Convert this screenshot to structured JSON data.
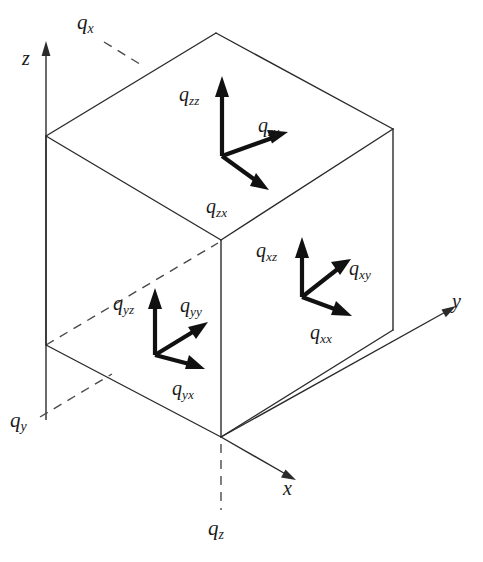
{
  "figure": {
    "type": "isometric-cube-tensor-diagram",
    "background_color": "#ffffff",
    "line_color": "#2b2b2b",
    "vector_color": "#111111",
    "width": 483,
    "height": 562
  },
  "axes": [
    {
      "id": "z",
      "label": "z",
      "symbol": "z",
      "direction": "up",
      "label_x": 22,
      "label_y": 48
    },
    {
      "id": "x",
      "label": "x",
      "symbol": "x",
      "direction": "down-right",
      "label_x": 283,
      "label_y": 478
    },
    {
      "id": "y",
      "label": "y",
      "symbol": "y",
      "direction": "up-right",
      "label_x": 452,
      "label_y": 291
    }
  ],
  "face_labels": [
    {
      "id": "qx",
      "base": "q",
      "sub": "x",
      "face": "top",
      "leader": "dashed",
      "label_x": 77,
      "label_y": 12
    },
    {
      "id": "qy",
      "base": "q",
      "sub": "y",
      "face": "left",
      "leader": "dashed",
      "label_x": 10,
      "label_y": 410
    },
    {
      "id": "qz",
      "base": "q",
      "sub": "z",
      "face": "bottom",
      "leader": "dashed",
      "label_x": 208,
      "label_y": 518
    }
  ],
  "triads": [
    {
      "id": "top-face",
      "face": "top",
      "origin_x": 222,
      "origin_y": 156,
      "vectors": [
        {
          "id": "qzz",
          "base": "q",
          "sub": "zz",
          "direction": "up",
          "label_x": 179,
          "label_y": 84
        },
        {
          "id": "qzy",
          "base": "q",
          "sub": "zy",
          "direction": "up-right",
          "label_x": 258,
          "label_y": 115
        },
        {
          "id": "qzx",
          "base": "q",
          "sub": "zx",
          "direction": "down-right",
          "label_x": 206,
          "label_y": 196
        }
      ]
    },
    {
      "id": "left-face",
      "face": "left",
      "origin_x": 155,
      "origin_y": 355,
      "vectors": [
        {
          "id": "qyz",
          "base": "q",
          "sub": "yz",
          "direction": "up",
          "label_x": 113,
          "label_y": 293
        },
        {
          "id": "qyy",
          "base": "q",
          "sub": "yy",
          "direction": "up-right",
          "label_x": 180,
          "label_y": 295
        },
        {
          "id": "qyx",
          "base": "q",
          "sub": "yx",
          "direction": "down-right",
          "label_x": 172,
          "label_y": 378
        }
      ]
    },
    {
      "id": "right-face",
      "face": "right",
      "origin_x": 302,
      "origin_y": 297,
      "vectors": [
        {
          "id": "qxz",
          "base": "q",
          "sub": "xz",
          "direction": "up",
          "label_x": 256,
          "label_y": 240
        },
        {
          "id": "qxy",
          "base": "q",
          "sub": "xy",
          "direction": "up-right",
          "label_x": 349,
          "label_y": 258
        },
        {
          "id": "qxx",
          "base": "q",
          "sub": "xx",
          "direction": "down-right",
          "label_x": 310,
          "label_y": 322
        }
      ]
    }
  ]
}
